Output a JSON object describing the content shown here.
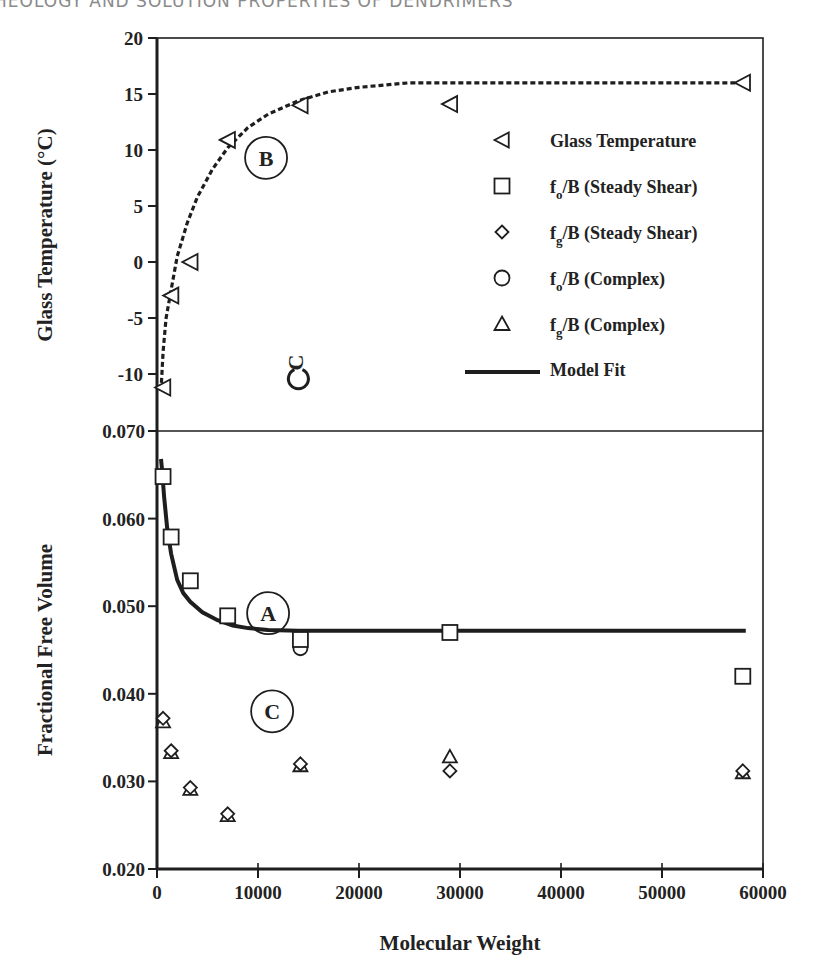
{
  "page": {
    "running_head": "HEOLOGY AND SOLUTION PROPERTIES OF DENDRIMERS"
  },
  "chart_data": [
    {
      "type": "scatter",
      "panel": "top",
      "title": "",
      "xlabel": "Molecular Weight",
      "ylabel": "Glass Temperature (°C)",
      "xlim": [
        0,
        60000
      ],
      "ylim": [
        -12,
        20
      ],
      "yticks": [
        20,
        15,
        10,
        5,
        0,
        -5,
        -10
      ],
      "ytick_labels": [
        "20",
        "15",
        "10",
        "5",
        "0",
        "-5",
        "-10"
      ],
      "grid": false,
      "series": [
        {
          "name": "Glass Temperature",
          "marker": "triangle-left",
          "x": [
            600,
            1400,
            3300,
            7000,
            14200,
            29000,
            58000
          ],
          "y": [
            -11.2,
            -3.0,
            0.0,
            10.9,
            14.0,
            14.1,
            16.0
          ]
        },
        {
          "name": "Fit B (dashed)",
          "style": "dashed",
          "x": [
            400,
            600,
            900,
            1400,
            2000,
            3000,
            4000,
            5500,
            7000,
            9000,
            11000,
            14000,
            17000,
            20000,
            25000,
            30000,
            40000,
            50000,
            58000
          ],
          "y": [
            -11.5,
            -8.0,
            -5.0,
            -2.5,
            0.5,
            3.5,
            5.8,
            8.3,
            10.2,
            12.0,
            13.2,
            14.4,
            15.2,
            15.6,
            16.0,
            16.0,
            16.0,
            16.0,
            16.0
          ]
        }
      ],
      "annotations": [
        {
          "text": "B",
          "x": 10800,
          "y": 9.3,
          "circled": true
        },
        {
          "text": "C",
          "x": 14000,
          "y": -8.8,
          "circled": true,
          "rotated": true
        }
      ]
    },
    {
      "type": "scatter",
      "panel": "bottom",
      "title": "",
      "xlabel": "Molecular Weight",
      "ylabel": "Fractional Free Volume",
      "xlim": [
        0,
        60000
      ],
      "ylim": [
        0.02,
        0.07
      ],
      "xticks": [
        0,
        10000,
        20000,
        30000,
        40000,
        50000,
        60000
      ],
      "xtick_labels": [
        "0",
        "10000",
        "20000",
        "30000",
        "40000",
        "50000",
        "60000"
      ],
      "yticks": [
        0.07,
        0.06,
        0.05,
        0.04,
        0.03,
        0.02
      ],
      "ytick_labels": [
        "0.070",
        "0.060",
        "0.050",
        "0.040",
        "0.030",
        "0.020"
      ],
      "grid": false,
      "series": [
        {
          "name": "fo/B (Steady Shear)",
          "marker": "square",
          "x": [
            600,
            1400,
            3300,
            7000,
            14200,
            29000,
            58000
          ],
          "y": [
            0.0648,
            0.0579,
            0.0529,
            0.0489,
            0.0462,
            0.047,
            0.042
          ]
        },
        {
          "name": "fg/B (Steady Shear)",
          "marker": "diamond",
          "x": [
            600,
            1400,
            3300,
            7000,
            14200,
            29000,
            58000
          ],
          "y": [
            0.0372,
            0.0335,
            0.0293,
            0.0263,
            0.032,
            0.0312,
            0.0312
          ]
        },
        {
          "name": "fo/B (Complex)",
          "marker": "circle",
          "x": [
            14200
          ],
          "y": [
            0.0452
          ]
        },
        {
          "name": "fg/B (Complex)",
          "marker": "triangle-up",
          "x": [
            600,
            1400,
            3300,
            7000,
            14200,
            29000,
            58000
          ],
          "y": [
            0.0368,
            0.0333,
            0.0291,
            0.0261,
            0.0318,
            0.0328,
            0.031
          ]
        },
        {
          "name": "Model Fit",
          "style": "solid",
          "x": [
            400,
            500,
            700,
            1000,
            1400,
            2000,
            2600,
            3300,
            4500,
            6000,
            7500,
            9000,
            11000,
            14000,
            20000,
            30000,
            40000,
            50000,
            58300
          ],
          "y": [
            0.0668,
            0.0655,
            0.0625,
            0.059,
            0.056,
            0.053,
            0.0515,
            0.0505,
            0.0493,
            0.0484,
            0.0478,
            0.0475,
            0.0473,
            0.0472,
            0.0472,
            0.0472,
            0.0472,
            0.0472,
            0.0472
          ]
        }
      ],
      "annotations": [
        {
          "text": "A",
          "x": 11000,
          "y": 0.0492,
          "circled": true
        },
        {
          "text": "C",
          "x": 11400,
          "y": 0.038,
          "circled": true
        }
      ]
    }
  ],
  "legend": {
    "position": "upper-panel-right",
    "items": [
      {
        "marker": "triangle-left",
        "label": "Glass Temperature"
      },
      {
        "marker": "square",
        "label_main": "f",
        "label_sub": "o",
        "label_rest": "/B (Steady Shear)"
      },
      {
        "marker": "diamond",
        "label_main": "f",
        "label_sub": "g",
        "label_rest": "/B (Steady Shear)"
      },
      {
        "marker": "circle",
        "label_main": "f",
        "label_sub": "o",
        "label_rest": "/B (Complex)"
      },
      {
        "marker": "triangle-up",
        "label_main": "f",
        "label_sub": "g",
        "label_rest": "/B (Complex)"
      },
      {
        "marker": "line",
        "label": "Model Fit"
      }
    ]
  },
  "colors": {
    "ink": "#1e1e1e",
    "background": "#ffffff",
    "running_head": "#8a8a8a"
  }
}
